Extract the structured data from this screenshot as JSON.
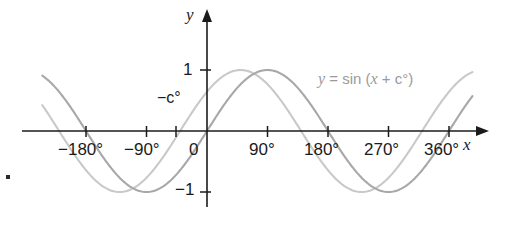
{
  "chart_data": {
    "type": "line",
    "title": "",
    "xlabel": "x",
    "ylabel": "y",
    "xlim": [
      -250,
      410
    ],
    "ylim": [
      -1.35,
      1.35
    ],
    "grid": false,
    "legend_position": "inline-annotation",
    "x_ticks": [
      {
        "value": -180,
        "label": "−180°"
      },
      {
        "value": -90,
        "label": "−90°"
      },
      {
        "value": 0,
        "label": "0"
      },
      {
        "value": 90,
        "label": "90°"
      },
      {
        "value": 180,
        "label": "180°"
      },
      {
        "value": 270,
        "label": "270°"
      },
      {
        "value": 360,
        "label": "360°"
      }
    ],
    "y_ticks": [
      {
        "value": 1,
        "label": "1"
      },
      {
        "value": -1,
        "label": "−1"
      }
    ],
    "annotations": [
      {
        "name": "phase-shift-marker",
        "label": "−c°",
        "x": -40,
        "y": 0
      }
    ],
    "series": [
      {
        "name": "y = sin x",
        "equation": "y = sin x",
        "color": "#a8a8a8",
        "amplitude": 1,
        "period": 360,
        "phase_deg": 0,
        "x_start": -245,
        "x_end": 395
      },
      {
        "name": "y = sin (x + c°)",
        "equation": "y = sin (x + c°)",
        "color": "#c9c9c9",
        "amplitude": 1,
        "period": 360,
        "phase_deg": 40,
        "x_start": -245,
        "x_end": 395
      }
    ]
  },
  "labels": {
    "y_axis": "y",
    "x_axis": "x",
    "y_tick_one": "1",
    "y_tick_minus_one": "−1",
    "x_tick_minus180": "−180°",
    "x_tick_minus90": "−90°",
    "x_tick_zero": "0",
    "x_tick_90": "90°",
    "x_tick_180": "180°",
    "x_tick_270": "270°",
    "x_tick_360": "360°",
    "phase_shift": "−c°",
    "curve_equation_italic_y": "y",
    "curve_equation_rest": " = sin (",
    "curve_equation_x": "x",
    "curve_equation_tail": " + c°)"
  },
  "colors": {
    "axis": "#1b1b1b",
    "curve_primary": "#a8a8a8",
    "curve_secondary": "#c9c9c9",
    "text": "#1b1b1b",
    "label_text": "#9a9a9a",
    "background": "#ffffff"
  }
}
